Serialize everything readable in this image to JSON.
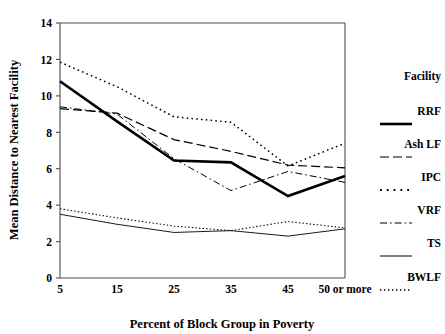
{
  "chart_data": {
    "type": "line",
    "title": "",
    "xlabel": "Percent of Block Group in Poverty",
    "ylabel": "Mean Distance to Nearest Facility",
    "categories": [
      "5",
      "15",
      "25",
      "35",
      "45",
      "50 or more"
    ],
    "xtick_labels": [
      "5",
      "15",
      "25",
      "35",
      "45",
      "50 or more"
    ],
    "ytick_labels": [
      "0",
      "2",
      "4",
      "6",
      "8",
      "10",
      "12",
      "14"
    ],
    "ylim": [
      0,
      14
    ],
    "ytick_step": 2,
    "grid": false,
    "legend_position": "right",
    "legend_title": "Facility",
    "series": [
      {
        "name": "RRF",
        "style": "solid-thick",
        "stroke_width": 2.6,
        "dasharray": "none",
        "values": [
          10.8,
          8.6,
          6.45,
          6.35,
          4.5,
          5.6
        ]
      },
      {
        "name": "Ash LF",
        "style": "long-dash",
        "stroke_width": 1.2,
        "dasharray": "9,4",
        "values": [
          9.3,
          9.05,
          7.6,
          6.95,
          6.2,
          6.05
        ]
      },
      {
        "name": "IPC",
        "style": "coarse-dot",
        "stroke_width": 1.5,
        "dasharray": "1.6,3.2",
        "values": [
          11.85,
          10.5,
          8.85,
          8.55,
          6.15,
          7.4
        ]
      },
      {
        "name": "VRF",
        "style": "dash-dot",
        "stroke_width": 1.0,
        "dasharray": "7,3,1.6,3",
        "values": [
          9.4,
          9.0,
          6.55,
          4.8,
          5.85,
          5.25
        ]
      },
      {
        "name": "TS",
        "style": "solid-thin",
        "stroke_width": 0.9,
        "dasharray": "none",
        "values": [
          3.5,
          2.95,
          2.5,
          2.6,
          2.3,
          2.7
        ]
      },
      {
        "name": "BWLF",
        "style": "fine-dot",
        "stroke_width": 1.1,
        "dasharray": "1.4,2.2",
        "values": [
          3.8,
          3.3,
          2.85,
          2.6,
          3.1,
          2.75
        ]
      }
    ]
  },
  "colors": {
    "ink": "#000000",
    "axis": "#4d4d4d",
    "background": "#ffffff"
  }
}
